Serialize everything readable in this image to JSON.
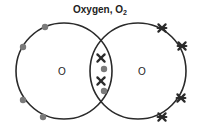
{
  "title": {
    "text": "Oxygen, O",
    "subscript": "2"
  },
  "atoms": [
    {
      "symbol": "O",
      "cx": 64,
      "cy": 71,
      "r": 48
    },
    {
      "symbol": "O",
      "cx": 138,
      "cy": 71,
      "r": 48
    }
  ],
  "colors": {
    "outline": "#2a2a2a",
    "dot": "#7a7a7a",
    "cross": "#2a2a2a"
  },
  "electrons": {
    "left_dots": [
      [
        45,
        27
      ],
      [
        23,
        47
      ],
      [
        23,
        100
      ],
      [
        43,
        117
      ]
    ],
    "right_crosses": [
      [
        162,
        28
      ],
      [
        182,
        46
      ],
      [
        181,
        98
      ],
      [
        162,
        117
      ]
    ],
    "shared_crosses": [
      [
        101,
        58
      ],
      [
        101,
        81
      ]
    ],
    "shared_dots": [
      [
        104,
        69
      ],
      [
        104,
        91
      ]
    ]
  }
}
